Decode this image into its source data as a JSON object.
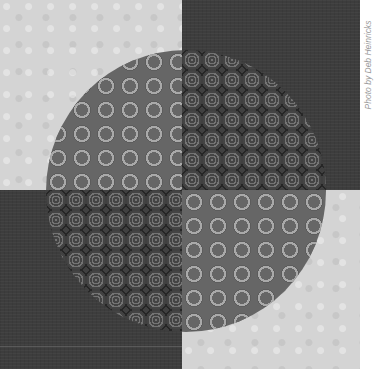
{
  "image": {
    "subject": "Quilt block: circle pieced into four quadrants over a four-patch background",
    "colors": {
      "background_light": "#d4d4d4",
      "background_dark": "#3d3d3d",
      "leaf_print": "#666666",
      "swirl_print": "#8e8e8e"
    },
    "layout": {
      "top_left": "light floral print",
      "top_right": "dark solid",
      "bottom_left": "dark solid",
      "bottom_right": "light floral print",
      "circle_top_left": "dark leaf print",
      "circle_top_right": "light swirl print",
      "circle_bottom_left": "light swirl print",
      "circle_bottom_right": "dark leaf print"
    }
  },
  "caption": "Photo by Deb Heinricks"
}
